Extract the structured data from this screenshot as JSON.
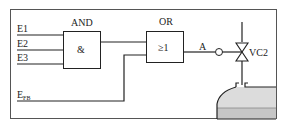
{
  "diagram": {
    "inputs": [
      {
        "id": "E1",
        "label": "E1"
      },
      {
        "id": "E2",
        "label": "E2"
      },
      {
        "id": "E3",
        "label": "E3"
      }
    ],
    "feedback": {
      "label": "E",
      "subscript": "FB"
    },
    "and_gate": {
      "title": "AND",
      "symbol": "&"
    },
    "or_gate": {
      "title": "OR",
      "symbol": "≥1"
    },
    "output": {
      "label": "A"
    },
    "valve": {
      "label": "VC2"
    },
    "colors": {
      "line": "#222222",
      "tank_fill": "#d9d9d9",
      "tank_liquid": "#c4c4c4"
    }
  }
}
